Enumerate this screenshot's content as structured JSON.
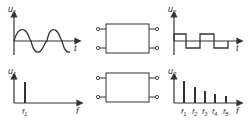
{
  "panels": {
    "top_left": {
      "y_label": "u",
      "y_sub": "1",
      "x_label": "t",
      "waveform": "sine"
    },
    "top_block": {
      "name": "two-port network"
    },
    "top_right": {
      "y_label": "u",
      "y_sub": "2",
      "x_label": "t",
      "waveform": "square"
    },
    "bottom_left": {
      "y_label": "u",
      "y_sub": "1",
      "x_label": "f",
      "spectrum_labels": [
        "f1"
      ]
    },
    "bottom_block": {
      "name": "two-port network"
    },
    "bottom_right": {
      "y_label": "u",
      "y_sub": "2",
      "x_label": "f",
      "spectrum_labels": [
        "f1",
        "f2",
        "f3",
        "f4",
        "f5"
      ]
    }
  },
  "colors": {
    "line": "#333333",
    "background": "#ffffff"
  }
}
